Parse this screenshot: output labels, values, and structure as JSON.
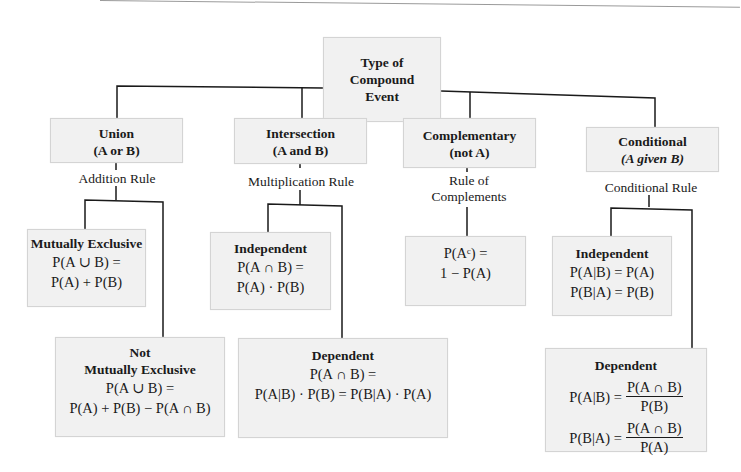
{
  "root": {
    "title_lines": [
      "Type of",
      "Compound",
      "Event"
    ]
  },
  "categories": [
    {
      "title": "Union",
      "subtitle": "(A or B)",
      "rule": "Addition Rule",
      "leaves": [
        {
          "title": "Mutually Exclusive",
          "formula_lines": [
            "P(A ∪ B) =",
            "P(A) + P(B)"
          ]
        },
        {
          "title_lines": [
            "Not",
            "Mutually Exclusive"
          ],
          "formula_lines": [
            "P(A ∪ B) =",
            "P(A) + P(B) − P(A ∩ B)"
          ]
        }
      ]
    },
    {
      "title": "Intersection",
      "subtitle": "(A and B)",
      "rule": "Multiplication Rule",
      "leaves": [
        {
          "title": "Independent",
          "formula_lines": [
            "P(A ∩ B) =",
            "P(A) · P(B)"
          ]
        },
        {
          "title": "Dependent",
          "formula_lines": [
            "P(A ∩ B) =",
            "P(A|B) · P(B) = P(B|A) · P(A)"
          ]
        }
      ]
    },
    {
      "title": "Complementary",
      "subtitle": "(not A)",
      "rule_lines": [
        "Rule of",
        "Complements"
      ],
      "leaves": [
        {
          "formula_lines": [
            "P(Aᶜ) =",
            "1 − P(A)"
          ]
        }
      ]
    },
    {
      "title": "Conditional",
      "subtitle": "(A given B)",
      "rule": "Conditional Rule",
      "leaves": [
        {
          "title": "Independent",
          "formula_lines": [
            "P(A|B) = P(A)",
            "P(B|A) = P(B)"
          ]
        },
        {
          "title": "Dependent",
          "fractions": [
            {
              "lhs": "P(A|B) =",
              "num": "P(A ∩ B)",
              "den": "P(B)"
            },
            {
              "lhs": "P(B|A) =",
              "num": "P(A ∩ B)",
              "den": "P(A)"
            }
          ]
        }
      ]
    }
  ],
  "colors": {
    "box_fill": "#f1f1f1",
    "box_border": "#d4d4d4",
    "line": "#1a1a1a"
  }
}
